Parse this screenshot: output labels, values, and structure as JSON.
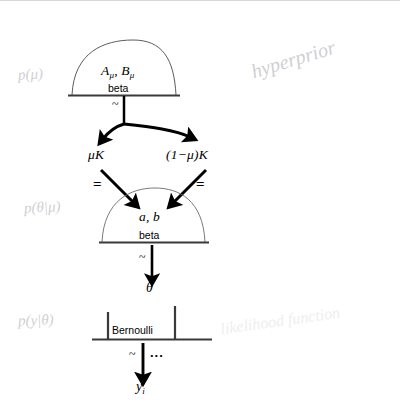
{
  "figure": {
    "kind": "hierarchical-bayesian-model-diagram",
    "background_color": "#ffffff",
    "ink_color": "#000000",
    "pencil_color": "#b9b9bd",
    "width": 400,
    "height": 411
  },
  "nodes": {
    "hyperprior": {
      "shape": "beta-density-curve",
      "params": "A",
      "params_sub1": "μ",
      "params_mid": ", B",
      "params_sub2": "μ",
      "distribution": "beta",
      "relation": "~"
    },
    "mu_k": {
      "label": "μK",
      "relation": "="
    },
    "one_minus_mu_k": {
      "label_open": "(1−μ)",
      "label_k": "K",
      "relation": "="
    },
    "prior": {
      "shape": "beta-density-curve",
      "params": "a, b",
      "distribution": "beta",
      "relation": "~"
    },
    "theta": {
      "label": "θ"
    },
    "likelihood": {
      "shape": "bernoulli-spikes",
      "distribution": "Bernoulli",
      "relation": "~",
      "ellipsis": "..."
    },
    "observation": {
      "label": "y",
      "label_sub": "i"
    }
  },
  "annotations": [
    {
      "text": "p(μ)",
      "role": "hyperprior-annotation"
    },
    {
      "text": "hyperprior",
      "role": "hyperprior-annotation"
    },
    {
      "text": "p(θ|μ)",
      "role": "prior-annotation"
    },
    {
      "text": "p(y|θ)",
      "role": "likelihood-annotation"
    },
    {
      "text": "likelihood function",
      "role": "likelihood-annotation"
    }
  ]
}
